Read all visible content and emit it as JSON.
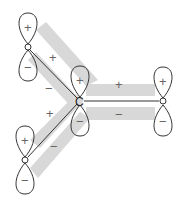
{
  "diagram": {
    "type": "p-orbital overlap (pi system) diagram",
    "colors": {
      "lobe_stroke": "#333333",
      "overlap_band": "#d8d8d8",
      "bond": "#333333",
      "sign": "#666666"
    },
    "atoms": [
      {
        "id": "O1",
        "label": "O",
        "x": 28,
        "y": 47,
        "upper_sign": "+",
        "lower_sign": "−"
      },
      {
        "id": "C",
        "label": "C",
        "x": 80,
        "y": 101,
        "upper_sign": "+",
        "lower_sign": "−"
      },
      {
        "id": "O2",
        "label": "O",
        "x": 163,
        "y": 101,
        "upper_sign": "+",
        "lower_sign": "−"
      },
      {
        "id": "O3",
        "label": "O",
        "x": 25,
        "y": 160,
        "upper_sign": "+",
        "lower_sign": "−"
      }
    ],
    "bonds": [
      {
        "from": "O1",
        "to": "C",
        "upper_sign": "+",
        "lower_sign": "−"
      },
      {
        "from": "C",
        "to": "O2",
        "upper_sign": "+",
        "lower_sign": "−"
      },
      {
        "from": "O3",
        "to": "C",
        "upper_sign": "+",
        "lower_sign": "−"
      }
    ]
  }
}
